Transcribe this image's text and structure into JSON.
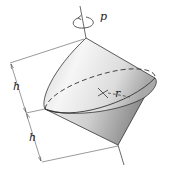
{
  "figure": {
    "labels": {
      "spin": "p",
      "height_upper": "h",
      "height_lower": "h",
      "radius": "r"
    },
    "colors": {
      "outline": "#333333",
      "dimension": "#555555",
      "surface_light": "#f4f4f4",
      "surface_dark": "#8a8a8a"
    }
  }
}
